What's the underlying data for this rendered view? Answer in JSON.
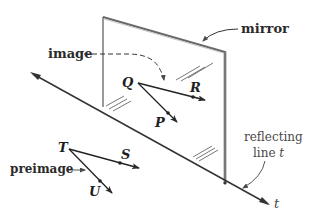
{
  "diagram": {
    "labels": {
      "mirror": "mirror",
      "image": "image",
      "preimage": "preimage",
      "reflecting_line_1": "reflecting",
      "reflecting_line_2": "line ",
      "reflecting_line_var": "t",
      "line_t": "t"
    },
    "points": {
      "Q": "Q",
      "R": "R",
      "P": "P",
      "T": "T",
      "S": "S",
      "U": "U"
    },
    "colors": {
      "stroke": "#2a2a2a",
      "mirror_edge": "#7a7a7a",
      "background": "#ffffff"
    }
  }
}
